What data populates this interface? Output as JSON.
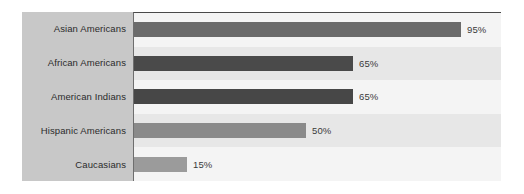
{
  "chart_data": {
    "type": "bar",
    "orientation": "horizontal",
    "title": "",
    "xlabel": "",
    "ylabel": "",
    "xlim": [
      0,
      100
    ],
    "grid": false,
    "legend": null,
    "value_suffix": "%",
    "categories": [
      "Asian Americans",
      "African Americans",
      "American Indians",
      "Hispanic Americans",
      "Caucasians"
    ],
    "values": [
      95,
      65,
      65,
      50,
      15
    ],
    "value_labels": [
      "95%",
      "65%",
      "65%",
      "50%",
      "15%"
    ],
    "bars": [
      {
        "category": "Asian Americans",
        "value": 95,
        "label": "95%",
        "bar_px": 327,
        "color": "#6b6b6b"
      },
      {
        "category": "African Americans",
        "value": 65,
        "label": "65%",
        "bar_px": 219,
        "color": "#4a4a4a"
      },
      {
        "category": "American Indians",
        "value": 65,
        "label": "65%",
        "bar_px": 219,
        "color": "#474747"
      },
      {
        "category": "Hispanic Americans",
        "value": 50,
        "label": "50%",
        "bar_px": 172,
        "color": "#8a8a8a"
      },
      {
        "category": "Caucasians",
        "value": 15,
        "label": "15%",
        "bar_px": 53,
        "color": "#9b9b9b"
      }
    ]
  },
  "style": {
    "label_gutter_color": "#c8c8c8",
    "band_dark_color": "#e7e7e7",
    "band_light_color": "#f4f4f4",
    "axis_color": "#4a4a4a",
    "text_color": "#2b2b2b",
    "value_text_color": "#3a3a3a",
    "page_background": "#ffffff"
  }
}
